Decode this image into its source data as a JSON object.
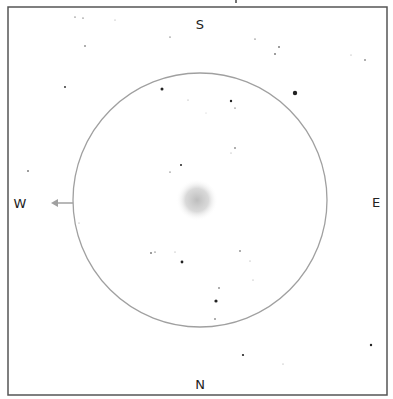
{
  "compass": {
    "top": "S",
    "bottom": "N",
    "left": "W",
    "right": "E"
  },
  "colors": {
    "frame": "#555555",
    "circle": "#a0a0a0",
    "arrow": "#a0a0a0",
    "star": "#222222",
    "glow": "#c8c8c8",
    "background": "#ffffff"
  },
  "frame": {
    "x": 8,
    "y": 7,
    "width": 379,
    "height": 388
  },
  "field_circle": {
    "cx": 200,
    "cy": 200,
    "r": 127
  },
  "direction_arrow": {
    "x1": 73,
    "y1": 203,
    "x2": 51,
    "y2": 203,
    "points_to": "W"
  },
  "target_object": {
    "cx": 197,
    "cy": 200,
    "r": 21,
    "type": "diffuse-glow"
  },
  "stars": [
    {
      "x": 75,
      "y": 17,
      "r": 0.6
    },
    {
      "x": 83,
      "y": 18,
      "r": 0.6
    },
    {
      "x": 115,
      "y": 20,
      "r": 0.5
    },
    {
      "x": 170,
      "y": 37,
      "r": 0.6
    },
    {
      "x": 85,
      "y": 46,
      "r": 0.7
    },
    {
      "x": 255,
      "y": 39,
      "r": 0.6
    },
    {
      "x": 279,
      "y": 47,
      "r": 0.8
    },
    {
      "x": 275,
      "y": 54,
      "r": 0.8
    },
    {
      "x": 351,
      "y": 55,
      "r": 0.5
    },
    {
      "x": 365,
      "y": 60,
      "r": 0.7
    },
    {
      "x": 65,
      "y": 87,
      "r": 0.9
    },
    {
      "x": 162,
      "y": 89,
      "r": 1.5
    },
    {
      "x": 295,
      "y": 93,
      "r": 2.2
    },
    {
      "x": 188,
      "y": 100,
      "r": 0.5
    },
    {
      "x": 231,
      "y": 101,
      "r": 1.2
    },
    {
      "x": 235,
      "y": 108,
      "r": 0.6
    },
    {
      "x": 206,
      "y": 113,
      "r": 0.4
    },
    {
      "x": 235,
      "y": 148,
      "r": 0.7
    },
    {
      "x": 231,
      "y": 153,
      "r": 0.5
    },
    {
      "x": 181,
      "y": 165,
      "r": 1.0
    },
    {
      "x": 170,
      "y": 172,
      "r": 0.6
    },
    {
      "x": 28,
      "y": 171,
      "r": 0.8
    },
    {
      "x": 79,
      "y": 223,
      "r": 0.5
    },
    {
      "x": 151,
      "y": 253,
      "r": 0.8
    },
    {
      "x": 155,
      "y": 252,
      "r": 0.6
    },
    {
      "x": 175,
      "y": 252,
      "r": 0.5
    },
    {
      "x": 182,
      "y": 262,
      "r": 1.4
    },
    {
      "x": 240,
      "y": 251,
      "r": 0.7
    },
    {
      "x": 250,
      "y": 261,
      "r": 0.5
    },
    {
      "x": 253,
      "y": 280,
      "r": 0.5
    },
    {
      "x": 219,
      "y": 288,
      "r": 0.7
    },
    {
      "x": 216,
      "y": 301,
      "r": 1.6
    },
    {
      "x": 215,
      "y": 319,
      "r": 0.7
    },
    {
      "x": 243,
      "y": 355,
      "r": 1.1
    },
    {
      "x": 283,
      "y": 364,
      "r": 0.5
    },
    {
      "x": 371,
      "y": 345,
      "r": 1.2
    }
  ]
}
